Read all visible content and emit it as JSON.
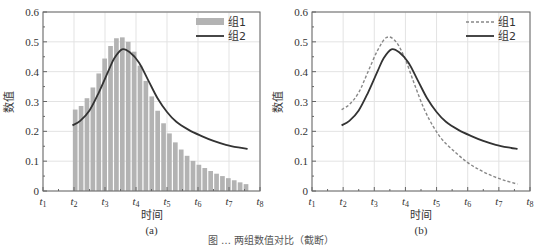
{
  "figure_caption": "图 … 两组数值对比（截断）",
  "chart_data": [
    {
      "type": "bar+line",
      "panel_label": "(a)",
      "xlabel": "时间",
      "ylabel": "数值",
      "ylim": [
        0,
        0.6
      ],
      "yticks": [
        "0",
        "0.1",
        "0.2",
        "0.3",
        "0.4",
        "0.5",
        "0.6"
      ],
      "xticks": [
        "t1",
        "t2",
        "t3",
        "t4",
        "t5",
        "t6",
        "t7",
        "t8"
      ],
      "xlim": [
        1,
        8
      ],
      "grid": true,
      "legend_position": "upper right",
      "series": [
        {
          "name": "组1",
          "style": "bar",
          "color": "#b3b3b3",
          "x_start": 1.95,
          "bin_width": 0.19,
          "values": [
            0.273,
            0.285,
            0.311,
            0.347,
            0.394,
            0.444,
            0.486,
            0.512,
            0.515,
            0.5,
            0.467,
            0.42,
            0.369,
            0.317,
            0.269,
            0.227,
            0.193,
            0.163,
            0.139,
            0.118,
            0.101,
            0.088,
            0.077,
            0.067,
            0.058,
            0.05,
            0.043,
            0.036,
            0.029,
            0.023
          ]
        },
        {
          "name": "组2",
          "style": "solid-line",
          "color": "#333333",
          "x": [
            1.95,
            2.2,
            2.5,
            2.8,
            3.1,
            3.3,
            3.55,
            3.8,
            4.1,
            4.4,
            4.7,
            5.0,
            5.3,
            5.7,
            6.1,
            6.5,
            6.9,
            7.3,
            7.6
          ],
          "values": [
            0.22,
            0.235,
            0.27,
            0.33,
            0.4,
            0.445,
            0.475,
            0.465,
            0.43,
            0.37,
            0.31,
            0.265,
            0.232,
            0.205,
            0.185,
            0.168,
            0.155,
            0.146,
            0.141
          ]
        }
      ]
    },
    {
      "type": "line",
      "panel_label": "(b)",
      "xlabel": "时间",
      "ylabel": "数值",
      "ylim": [
        0,
        0.6
      ],
      "yticks": [
        "0",
        "0.1",
        "0.2",
        "0.3",
        "0.4",
        "0.5",
        "0.6"
      ],
      "xticks": [
        "t1",
        "t2",
        "t3",
        "t4",
        "t5",
        "t6",
        "t7",
        "t8"
      ],
      "xlim": [
        1,
        8
      ],
      "grid": true,
      "legend_position": "upper right",
      "series": [
        {
          "name": "组1",
          "style": "dashed-line",
          "color": "#888888",
          "x": [
            1.95,
            2.2,
            2.5,
            2.8,
            3.1,
            3.4,
            3.7,
            4.0,
            4.3,
            4.6,
            4.9,
            5.2,
            5.6,
            6.0,
            6.4,
            6.8,
            7.2,
            7.6
          ],
          "values": [
            0.273,
            0.29,
            0.33,
            0.4,
            0.47,
            0.515,
            0.5,
            0.44,
            0.355,
            0.275,
            0.215,
            0.17,
            0.13,
            0.095,
            0.07,
            0.05,
            0.035,
            0.023
          ]
        },
        {
          "name": "组2",
          "style": "solid-line",
          "color": "#333333",
          "x": [
            1.95,
            2.2,
            2.5,
            2.8,
            3.1,
            3.3,
            3.55,
            3.8,
            4.1,
            4.4,
            4.7,
            5.0,
            5.3,
            5.7,
            6.1,
            6.5,
            6.9,
            7.3,
            7.6
          ],
          "values": [
            0.22,
            0.235,
            0.27,
            0.33,
            0.4,
            0.445,
            0.475,
            0.465,
            0.43,
            0.37,
            0.31,
            0.265,
            0.232,
            0.205,
            0.185,
            0.168,
            0.155,
            0.146,
            0.141
          ]
        }
      ]
    }
  ]
}
